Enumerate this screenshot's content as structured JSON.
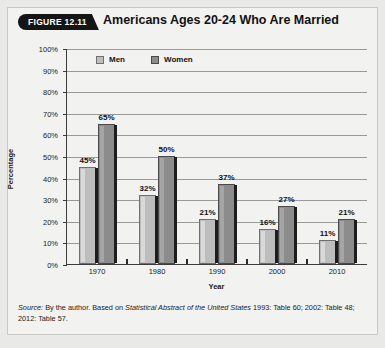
{
  "figure": {
    "badge_label": "FIGURE 12.11",
    "title": "Americans Ages 20-24 Who Are Married",
    "source_prefix": "Source:",
    "source_text_1": " By the author. Based on ",
    "source_italic": "Statistical Abstract of the United States",
    "source_text_2": " 1993: Table 60; 2002: Table 48; 2012: Table 57."
  },
  "colors": {
    "men_bar": "#bdbdbd",
    "women_bar": "#8c8c8c",
    "grid": "#9a9a96",
    "axis": "#3b3b3b",
    "card_background": "#f2f2f0",
    "badge_background": "#151515"
  },
  "chart_data": {
    "type": "bar",
    "title": "Americans Ages 20-24 Who Are Married",
    "categories": [
      "1970",
      "1980",
      "1990",
      "2000",
      "2010"
    ],
    "series": [
      {
        "name": "Men",
        "values": [
          45,
          32,
          21,
          16,
          11
        ],
        "labels": [
          "45%",
          "32%",
          "21%",
          "16%",
          "11%"
        ]
      },
      {
        "name": "Women",
        "values": [
          65,
          50,
          37,
          27,
          21
        ],
        "labels": [
          "65%",
          "50%",
          "37%",
          "27%",
          "21%"
        ]
      }
    ],
    "xlabel": "Year",
    "ylabel": "Percentage",
    "ylim": [
      0,
      100
    ],
    "ytick_labels": [
      "100%",
      "90%",
      "80%",
      "70%",
      "60%",
      "50%",
      "40%",
      "30%",
      "20%",
      "10%",
      "0%"
    ],
    "ytick_values": [
      100,
      90,
      80,
      70,
      60,
      50,
      40,
      30,
      20,
      10,
      0
    ],
    "grid": true,
    "legend_position": "top-left-inside"
  }
}
